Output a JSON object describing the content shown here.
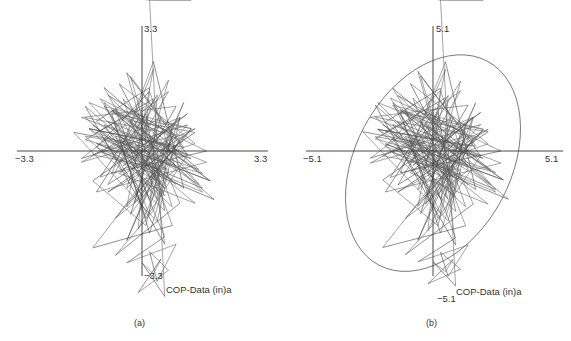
{
  "chart_data": [
    {
      "type": "line",
      "panel_label": "(a)",
      "title": "",
      "annotation": "COP-Data (in)a",
      "xlim": [
        -3.3,
        3.3
      ],
      "ylim": [
        -3.3,
        3.3
      ],
      "x_tick_labels": [
        "−3.3",
        "3.3"
      ],
      "y_tick_labels": [
        "3.3",
        "−3.3"
      ],
      "grid": false,
      "legend": "none",
      "confidence_ellipse": false,
      "series": [
        {
          "name": "COP trajectory",
          "x": [
            0.1,
            -1.2,
            0.9,
            -0.8,
            1.6,
            -1.5,
            0.3,
            -0.4,
            1.2,
            -1.6,
            0.7,
            -0.2,
            1.8,
            -1.0,
            0.2,
            1.0,
            -1.3,
            0.6,
            -0.6,
            1.4,
            -1.1,
            0.0,
            0.8,
            -1.4,
            1.1,
            -0.3,
            0.5,
            -0.9,
            1.7,
            -1.2,
            0.4,
            0.2,
            -0.7,
            1.3,
            -1.6,
            0.9,
            -0.1,
            0.6,
            -1.0,
            1.5,
            -0.5,
            0.3,
            1.1,
            -1.3,
            0.0,
            0.8,
            -0.8,
            1.9,
            -1.1,
            0.4,
            -0.4,
            1.2,
            -1.5,
            0.6,
            0.1,
            -0.6,
            1.4,
            -0.9,
            0.7,
            -0.2,
            1.0,
            -1.4,
            0.5,
            -0.3,
            1.6,
            -1.2,
            0.2,
            0.9,
            -0.7,
            1.3,
            -1.0,
            0.0,
            0.6,
            -1.5,
            1.1,
            -0.4,
            0.3,
            -0.8,
            1.7,
            -1.1,
            0.5,
            0.8,
            -0.5,
            1.2,
            -1.3,
            0.1,
            0.7,
            -0.9,
            1.5,
            -0.2,
            -1.8,
            0.4,
            1.0,
            -0.6,
            1.4,
            -1.2,
            0.2,
            -0.1,
            0.9,
            -1.4,
            0.6,
            0.3,
            -0.7,
            1.8,
            -1.0,
            0.0,
            1.1,
            -0.4,
            0.8,
            -1.6,
            0.5,
            -0.3,
            1.3,
            -0.8,
            0.2,
            0.7,
            -1.2,
            1.6,
            -0.5,
            0.4,
            -1.0,
            1.2,
            0.1,
            -0.6,
            0.9,
            -1.5,
            0.6,
            0.3,
            -0.9,
            1.4,
            -0.2,
            0.8,
            -1.3,
            0.5,
            1.0,
            -0.7,
            0.3,
            0.6,
            -0.4,
            0.9,
            0.4,
            0.2,
            0.7,
            -0.1,
            0.5,
            0.3,
            0.0,
            0.6,
            0.2,
            0.4,
            1.3,
            0.1
          ],
          "y": [
            1.2,
            0.5,
            -0.4,
            1.1,
            -0.6,
            0.3,
            1.4,
            -1.0,
            0.7,
            -0.2,
            1.6,
            0.0,
            -0.8,
            1.3,
            -1.3,
            0.9,
            -0.1,
            -0.5,
            1.8,
            0.2,
            -0.7,
            1.0,
            -1.5,
            0.6,
            0.1,
            2.0,
            -0.9,
            0.8,
            -0.3,
            -1.1,
            1.5,
            -1.7,
            0.4,
            -0.2,
            0.9,
            1.2,
            -0.6,
            -1.2,
            1.7,
            -0.5,
            0.2,
            2.4,
            -1.0,
            0.7,
            -0.4,
            0.5,
            1.1,
            -1.3,
            0.0,
            -0.8,
            2.1,
            -0.1,
            0.4,
            -1.6,
            1.0,
            -0.3,
            0.6,
            -0.9,
            1.9,
            -1.4,
            0.3,
            1.3,
            -0.7,
            0.8,
            -1.1,
            0.1,
            1.6,
            -0.5,
            -1.8,
            0.6,
            1.2,
            -0.2,
            -1.0,
            0.9,
            0.4,
            -1.5,
            2.2,
            -0.6,
            0.0,
            1.4,
            -1.2,
            0.7,
            -0.4,
            1.0,
            -0.8,
            -2.0,
            0.5,
            1.5,
            -0.9,
            0.2,
            0.5,
            -1.9,
            0.9,
            -0.6,
            -1.4,
            0.8,
            1.7,
            -2.1,
            0.1,
            0.6,
            -0.7,
            -1.6,
            1.1,
            -0.8,
            0.3,
            -1.2,
            1.3,
            -2.4,
            0.4,
            -0.3,
            0.9,
            -1.7,
            0.6,
            1.0,
            -2.2,
            -0.5,
            0.2,
            -1.0,
            1.4,
            -1.3,
            0.7,
            -0.1,
            -1.8,
            0.3,
            -0.9,
            1.2,
            -2.5,
            -0.4,
            -1.1,
            0.5,
            0.8,
            -2.0,
            -2.6,
            -0.2,
            -1.4,
            -2.8,
            -1.6,
            -2.3,
            -3.0,
            -2.5,
            -3.5,
            -2.7,
            -3.2,
            -3.8,
            -2.9,
            -3.3,
            -3.0,
            -3.9
          ]
        }
      ]
    },
    {
      "type": "line",
      "panel_label": "(b)",
      "title": "",
      "annotation": "COP-Data (in)a",
      "xlim": [
        -5.1,
        5.1
      ],
      "ylim": [
        -5.1,
        5.1
      ],
      "x_tick_labels": [
        "−5.1",
        "5.1"
      ],
      "y_tick_labels": [
        "5.1",
        "−5.1"
      ],
      "grid": false,
      "legend": "none",
      "confidence_ellipse": true,
      "ellipse": {
        "center": [
          0.0,
          -0.5
        ],
        "semi_major": 4.6,
        "semi_minor": 3.1,
        "angle_deg": -62
      },
      "series": [
        {
          "name": "COP trajectory",
          "x": [
            0.2,
            -1.9,
            1.4,
            -1.3,
            2.5,
            -2.3,
            0.5,
            -0.6,
            1.9,
            -2.5,
            1.1,
            -0.3,
            2.8,
            -1.6,
            0.3,
            1.6,
            -2.0,
            0.9,
            -0.9,
            2.2,
            -1.7,
            0.0,
            1.3,
            -2.2,
            1.7,
            -0.5,
            0.8,
            -1.4,
            2.7,
            -1.9,
            0.6,
            0.3,
            -1.1,
            2.0,
            -2.5,
            1.4,
            -0.2,
            0.9,
            -1.6,
            2.3,
            -0.8,
            0.5,
            1.7,
            -2.0,
            0.0,
            1.3,
            -1.3,
            3.0,
            -1.7,
            0.6,
            -0.6,
            1.9,
            -2.3,
            0.9,
            0.2,
            -0.9,
            2.2,
            -1.4,
            1.1,
            -0.3,
            1.6,
            -2.2,
            0.8,
            -0.5,
            2.5,
            -1.9,
            0.3,
            1.4,
            -1.1,
            2.0,
            -1.6,
            0.0,
            0.9,
            -2.3,
            1.7,
            -0.6,
            0.5,
            -1.3,
            2.7,
            -1.7,
            0.8,
            1.3,
            -0.8,
            1.9,
            -2.0,
            0.2,
            1.1,
            -1.4,
            2.3,
            -0.3,
            -2.8,
            0.6,
            1.6,
            -0.9,
            2.2,
            -1.9,
            0.3,
            -0.2,
            1.4,
            -2.2,
            0.9,
            0.5,
            -1.1,
            2.8,
            -1.6,
            0.0,
            1.7,
            -0.6,
            1.3,
            -2.5,
            0.8,
            -0.5,
            2.0,
            -1.3,
            0.3,
            1.1,
            -1.9,
            2.5,
            -0.8,
            0.6,
            -1.6,
            1.9,
            0.2,
            -0.9,
            1.4,
            -2.3,
            0.9,
            0.5,
            -1.4,
            2.2,
            -0.3,
            1.3,
            -2.0,
            0.8,
            1.6,
            -1.1,
            0.5,
            0.9,
            -0.6,
            1.4,
            0.6,
            0.3,
            1.1,
            -0.2,
            0.8,
            0.5,
            0.0,
            0.9,
            0.3,
            0.6,
            2.0,
            0.2
          ],
          "y": [
            1.8,
            0.8,
            -0.6,
            1.7,
            -0.9,
            0.5,
            2.2,
            -1.6,
            1.1,
            -0.3,
            2.5,
            0.0,
            -1.2,
            2.0,
            -2.0,
            1.4,
            -0.2,
            -0.8,
            2.8,
            0.3,
            -1.1,
            1.6,
            -2.3,
            0.9,
            0.2,
            3.1,
            -1.4,
            1.2,
            -0.5,
            -1.7,
            2.3,
            -2.6,
            0.6,
            -0.3,
            1.4,
            1.9,
            -0.9,
            -1.9,
            2.6,
            -0.8,
            0.3,
            3.7,
            -1.6,
            1.1,
            -0.6,
            0.8,
            1.7,
            -2.0,
            0.0,
            -1.2,
            3.3,
            -0.2,
            0.6,
            -2.5,
            1.6,
            -0.5,
            0.9,
            -1.4,
            2.9,
            -2.2,
            0.5,
            2.0,
            -1.1,
            1.2,
            -1.7,
            0.2,
            2.5,
            -0.8,
            -2.8,
            0.9,
            1.9,
            -0.3,
            -1.6,
            1.4,
            0.6,
            -2.3,
            3.4,
            -0.9,
            0.0,
            2.2,
            -1.9,
            1.1,
            -0.6,
            1.6,
            -1.2,
            -3.1,
            0.8,
            2.3,
            -1.4,
            0.3,
            0.8,
            -2.9,
            1.4,
            -0.9,
            -2.2,
            1.2,
            2.6,
            -3.3,
            0.2,
            0.9,
            -1.1,
            -2.5,
            1.7,
            -1.2,
            0.5,
            -1.9,
            2.0,
            -3.7,
            0.6,
            -0.5,
            1.4,
            -2.6,
            0.9,
            1.6,
            -3.4,
            -0.8,
            0.3,
            -1.6,
            2.2,
            -2.0,
            1.1,
            -0.2,
            -2.8,
            0.5,
            -1.4,
            1.9,
            -3.9,
            -0.6,
            -1.7,
            0.8,
            1.2,
            -3.1,
            -4.0,
            -0.3,
            -2.2,
            -4.3,
            -2.5,
            -3.6,
            -4.6,
            -3.9,
            -5.2,
            -4.2,
            -4.9,
            -5.5,
            -4.5,
            -5.0,
            -4.6,
            -5.6
          ]
        }
      ]
    }
  ],
  "figure": {
    "panel_a_caption": "(a)",
    "panel_b_caption": "(b)"
  }
}
